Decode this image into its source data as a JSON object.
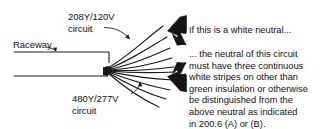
{
  "diagram": {
    "colors": {
      "ink": "#111111",
      "arrow_fill": "#141414",
      "background": "#ffffff",
      "wire": "#1a1a1a"
    },
    "labels": {
      "raceway": "Raceway",
      "circuit_208_line1": "208Y/120V",
      "circuit_208_line2": "circuit",
      "circuit_480_line1": "480Y/277V",
      "circuit_480_line2": "circuit"
    },
    "callouts": {
      "top": "If this is a white neutral...",
      "body_lines": [
        "... the neutral of this circuit",
        "must have three continuous",
        "white stripes on other than",
        "green insulation or otherwise",
        "be distinguished from the",
        "above neutral as indicated",
        "in 200.6 (A) or (B)."
      ]
    },
    "icons": {
      "arrow_top": "arrow-down-left-icon",
      "arrow_bottom": "arrow-up-left-icon",
      "leader_raceway": "leader-line-icon",
      "leader_208": "leader-line-icon",
      "leader_480": "leader-line-icon"
    },
    "geometry": {
      "raceway_top_y": 52,
      "raceway_bottom_y": 76,
      "bundle_x": 108,
      "upper_wire_count": 5,
      "lower_wire_count": 5
    }
  }
}
